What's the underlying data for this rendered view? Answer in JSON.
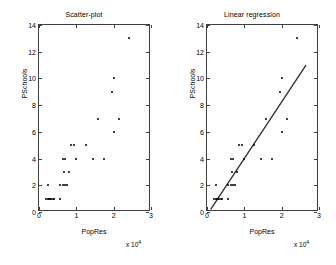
{
  "figure": {
    "panels": [
      {
        "name": "scatter",
        "title": "Scatter-plot",
        "xlabel": "PopRes",
        "ylabel": "PSchools",
        "exponent_label": "x 10",
        "exponent_value": "4"
      },
      {
        "name": "regression",
        "title": "Linear regression",
        "xlabel": "PopRes",
        "ylabel": "PSchools",
        "exponent_label": "x 10",
        "exponent_value": "4"
      }
    ]
  },
  "chart_data": [
    {
      "type": "scatter",
      "title": "Scatter-plot",
      "xlabel": "PopRes",
      "ylabel": "PSchools",
      "x_multiplier": 10000,
      "x_multiplier_label": "x 10^4",
      "xlim": [
        0,
        30000
      ],
      "ylim": [
        0,
        14
      ],
      "xticks": [
        0,
        10000,
        20000,
        30000
      ],
      "xtick_labels": [
        "0",
        "1",
        "2",
        "3"
      ],
      "yticks": [
        0,
        2,
        4,
        6,
        8,
        10,
        12,
        14
      ],
      "ytick_labels": [
        "0",
        "2",
        "4",
        "6",
        "8",
        "10",
        "12",
        "14"
      ],
      "grid": false,
      "legend": false,
      "points": [
        {
          "x": 2000,
          "y": 1
        },
        {
          "x": 2400,
          "y": 1
        },
        {
          "x": 2700,
          "y": 1
        },
        {
          "x": 3000,
          "y": 1
        },
        {
          "x": 3300,
          "y": 1
        },
        {
          "x": 3700,
          "y": 1
        },
        {
          "x": 4000,
          "y": 1
        },
        {
          "x": 5500,
          "y": 1
        },
        {
          "x": 2500,
          "y": 2
        },
        {
          "x": 5500,
          "y": 2
        },
        {
          "x": 6300,
          "y": 2
        },
        {
          "x": 7000,
          "y": 2
        },
        {
          "x": 7500,
          "y": 2
        },
        {
          "x": 6800,
          "y": 3
        },
        {
          "x": 8000,
          "y": 3
        },
        {
          "x": 6500,
          "y": 4
        },
        {
          "x": 7000,
          "y": 4
        },
        {
          "x": 10000,
          "y": 4
        },
        {
          "x": 14500,
          "y": 4
        },
        {
          "x": 17500,
          "y": 4
        },
        {
          "x": 8500,
          "y": 5
        },
        {
          "x": 9500,
          "y": 5
        },
        {
          "x": 12500,
          "y": 5
        },
        {
          "x": 20000,
          "y": 6
        },
        {
          "x": 15700,
          "y": 7
        },
        {
          "x": 21500,
          "y": 7
        },
        {
          "x": 19500,
          "y": 9
        },
        {
          "x": 20000,
          "y": 10
        },
        {
          "x": 24000,
          "y": 13
        }
      ]
    },
    {
      "type": "scatter",
      "title": "Linear regression",
      "xlabel": "PopRes",
      "ylabel": "PSchools",
      "x_multiplier": 10000,
      "x_multiplier_label": "x 10^4",
      "xlim": [
        0,
        30000
      ],
      "ylim": [
        0,
        14
      ],
      "xticks": [
        0,
        10000,
        20000,
        30000
      ],
      "xtick_labels": [
        "0",
        "1",
        "2",
        "3"
      ],
      "yticks": [
        0,
        2,
        4,
        6,
        8,
        10,
        12,
        14
      ],
      "ytick_labels": [
        "0",
        "2",
        "4",
        "6",
        "8",
        "10",
        "12",
        "14"
      ],
      "grid": false,
      "legend": false,
      "points": [
        {
          "x": 2000,
          "y": 1
        },
        {
          "x": 2400,
          "y": 1
        },
        {
          "x": 2700,
          "y": 1
        },
        {
          "x": 3000,
          "y": 1
        },
        {
          "x": 3300,
          "y": 1
        },
        {
          "x": 3700,
          "y": 1
        },
        {
          "x": 4000,
          "y": 1
        },
        {
          "x": 5500,
          "y": 1
        },
        {
          "x": 2500,
          "y": 2
        },
        {
          "x": 5500,
          "y": 2
        },
        {
          "x": 6300,
          "y": 2
        },
        {
          "x": 7000,
          "y": 2
        },
        {
          "x": 7500,
          "y": 2
        },
        {
          "x": 6800,
          "y": 3
        },
        {
          "x": 8000,
          "y": 3
        },
        {
          "x": 6500,
          "y": 4
        },
        {
          "x": 7000,
          "y": 4
        },
        {
          "x": 10000,
          "y": 4
        },
        {
          "x": 14500,
          "y": 4
        },
        {
          "x": 17500,
          "y": 4
        },
        {
          "x": 8500,
          "y": 5
        },
        {
          "x": 9500,
          "y": 5
        },
        {
          "x": 12500,
          "y": 5
        },
        {
          "x": 20000,
          "y": 6
        },
        {
          "x": 15700,
          "y": 7
        },
        {
          "x": 21500,
          "y": 7
        },
        {
          "x": 19500,
          "y": 9
        },
        {
          "x": 20000,
          "y": 10
        },
        {
          "x": 24000,
          "y": 13
        }
      ],
      "fit_line": {
        "type": "line",
        "x_start": 1000,
        "y_start": 0,
        "x_end": 27000,
        "y_end": 11,
        "color": "#2a2a2a"
      }
    }
  ]
}
